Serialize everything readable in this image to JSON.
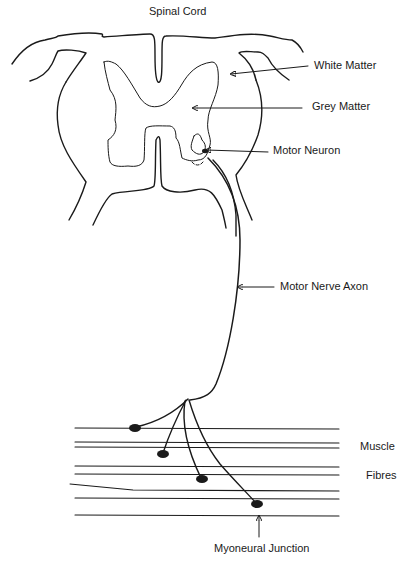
{
  "title": "Spinal Cord",
  "labels": {
    "white_matter": "White Matter",
    "grey_matter": "Grey Matter",
    "motor_neuron": "Motor Neuron",
    "motor_nerve_axon": "Motor Nerve Axon",
    "muscle": "Muscle",
    "fibres": "Fibres",
    "myoneural_junction": "Myoneural Junction"
  },
  "colors": {
    "stroke": "#1a1a1a",
    "background": "#ffffff"
  }
}
